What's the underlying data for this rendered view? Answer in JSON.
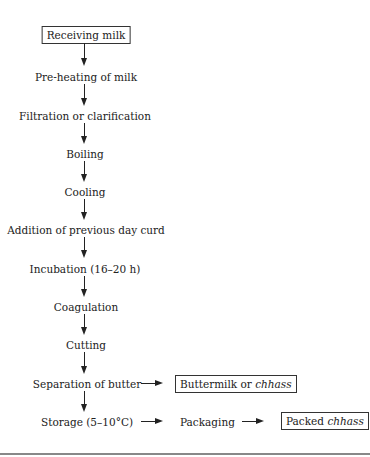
{
  "diagram": {
    "type": "flowchart",
    "main_flow": [
      {
        "id": "receiving",
        "label": "Receiving milk",
        "boxed": true
      },
      {
        "id": "preheat",
        "label": "Pre-heating of milk",
        "boxed": false
      },
      {
        "id": "filtration",
        "label": "Filtration or clarification",
        "boxed": false
      },
      {
        "id": "boiling",
        "label": "Boiling",
        "boxed": false
      },
      {
        "id": "cooling",
        "label": "Cooling",
        "boxed": false
      },
      {
        "id": "addition",
        "label": "Addition of previous day curd",
        "boxed": false
      },
      {
        "id": "incubation",
        "label": "Incubation (16–20 h)",
        "boxed": false
      },
      {
        "id": "coagulation",
        "label": "Coagulation",
        "boxed": false
      },
      {
        "id": "cutting",
        "label": "Cutting",
        "boxed": false
      },
      {
        "id": "separation",
        "label": "Separation of butter",
        "boxed": false
      },
      {
        "id": "storage",
        "label": "Storage (5–10°C)",
        "boxed": false
      }
    ],
    "side_nodes": {
      "buttermilk": {
        "prefix": "Buttermilk or ",
        "italic": "chhass",
        "boxed": true
      },
      "packaging": {
        "label": "Packaging",
        "boxed": false
      },
      "packed": {
        "prefix": "Packed ",
        "italic": "chhass",
        "boxed": true
      }
    },
    "edges": [
      [
        "receiving",
        "preheat"
      ],
      [
        "preheat",
        "filtration"
      ],
      [
        "filtration",
        "boiling"
      ],
      [
        "boiling",
        "cooling"
      ],
      [
        "cooling",
        "addition"
      ],
      [
        "addition",
        "incubation"
      ],
      [
        "incubation",
        "coagulation"
      ],
      [
        "coagulation",
        "cutting"
      ],
      [
        "cutting",
        "separation"
      ],
      [
        "separation",
        "storage"
      ],
      [
        "separation",
        "buttermilk"
      ],
      [
        "storage",
        "packaging"
      ],
      [
        "packaging",
        "packed"
      ]
    ]
  }
}
